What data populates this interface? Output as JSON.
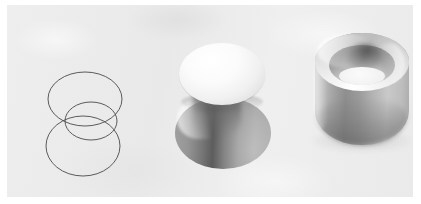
{
  "figure": {
    "caption": "",
    "background_color": "#ececec",
    "page_color": "#ffffff",
    "panel": {
      "x": 7,
      "y": 5,
      "width": 406,
      "height": 192
    },
    "ghost_text": {
      "line_1": "",
      "line_2": "",
      "line_3": ""
    },
    "objects": [
      {
        "id": "wireframe-circles",
        "name": "wireframe-three-circles",
        "label": "",
        "kind": "wireframe",
        "stroke_color": "#4a4a4a",
        "stroke_width": 0.9,
        "fill": "none",
        "circles": [
          {
            "name": "upper-large-ellipse",
            "cx": 48,
            "cy": 38,
            "rx": 37,
            "ry": 27
          },
          {
            "name": "middle-small-ellipse",
            "cx": 54,
            "cy": 60,
            "rx": 26,
            "ry": 19
          },
          {
            "name": "lower-large-ellipse",
            "cx": 46,
            "cy": 85,
            "rx": 37,
            "ry": 30
          }
        ]
      },
      {
        "id": "shaded-disk-cone",
        "name": "shaded-disk-over-cone",
        "label": "",
        "kind": "shaded-solid",
        "parts": [
          {
            "name": "disk-top",
            "shading": "bright",
            "highlight": "#ffffff",
            "shadow": "#e4e4e4"
          },
          {
            "name": "cone-body",
            "shading": "gradient",
            "highlight": "#d8d8d8",
            "shadow": "#6e6e6e"
          }
        ]
      },
      {
        "id": "shaded-cup",
        "name": "shaded-cylindrical-cup",
        "label": "",
        "kind": "shaded-solid",
        "parts": [
          {
            "name": "outer-wall",
            "shading": "gradient",
            "highlight": "#cccccc",
            "shadow": "#8e8e8e"
          },
          {
            "name": "rim",
            "shading": "bright",
            "highlight": "#ffffff",
            "shadow": "#bcbcbc"
          },
          {
            "name": "inner-cavity",
            "shading": "gradient",
            "highlight": "#f3f3f3",
            "shadow": "#6e6e6e"
          }
        ]
      }
    ]
  }
}
